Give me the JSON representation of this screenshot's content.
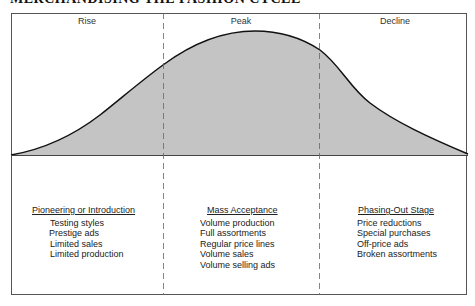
{
  "title": "MERCHANDISING THE FASHION CYCLE",
  "colors": {
    "curve_fill": "#c4c4c4",
    "curve_stroke": "#111111",
    "frame": "#555555",
    "divider": "#666666"
  },
  "phases": [
    {
      "label": "Rise"
    },
    {
      "label": "Peak"
    },
    {
      "label": "Decline"
    }
  ],
  "stages": [
    {
      "heading": "Pioneering or Introduction",
      "items": [
        "Testing styles",
        "Prestige ads",
        "Limited sales",
        "Limited production"
      ]
    },
    {
      "heading": "Mass Acceptance",
      "items": [
        "Volume production",
        "Full assortments",
        "Regular price lines",
        "Volume sales",
        "Volume selling ads"
      ]
    },
    {
      "heading": "Phasing-Out Stage",
      "items": [
        "Price reductions",
        "Special purchases",
        "Off-price ads",
        "Broken assortments"
      ]
    }
  ]
}
